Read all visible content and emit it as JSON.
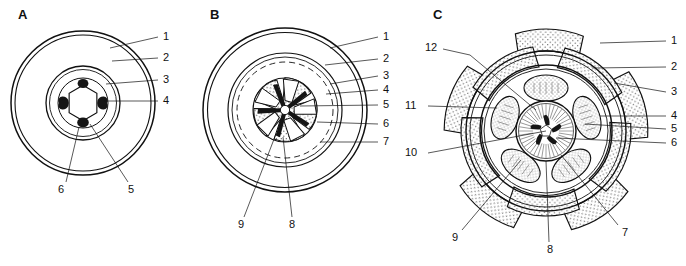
{
  "figure": {
    "background_color": "#ffffff",
    "ink_color": "#111111",
    "fill_black": "#151515",
    "stipple_color": "#555555",
    "panels": [
      {
        "letter": "A",
        "letter_x": 18,
        "letter_y": 8,
        "center_x": 83,
        "center_y": 103,
        "callouts": [
          {
            "label": "1",
            "x": 163,
            "y": 36
          },
          {
            "label": "2",
            "x": 163,
            "y": 57
          },
          {
            "label": "3",
            "x": 163,
            "y": 79
          },
          {
            "label": "4",
            "x": 163,
            "y": 100
          },
          {
            "label": "5",
            "x": 131,
            "y": 189
          },
          {
            "label": "6",
            "x": 60,
            "y": 189
          }
        ]
      },
      {
        "letter": "B",
        "letter_x": 210,
        "letter_y": 8,
        "center_x": 285,
        "center_y": 110,
        "callouts": [
          {
            "label": "1",
            "x": 383,
            "y": 36
          },
          {
            "label": "2",
            "x": 383,
            "y": 58
          },
          {
            "label": "3",
            "x": 383,
            "y": 75
          },
          {
            "label": "4",
            "x": 383,
            "y": 89
          },
          {
            "label": "5",
            "x": 383,
            "y": 104
          },
          {
            "label": "6",
            "x": 383,
            "y": 123
          },
          {
            "label": "7",
            "x": 383,
            "y": 141
          },
          {
            "label": "8",
            "x": 288,
            "y": 224
          },
          {
            "label": "9",
            "x": 238,
            "y": 224
          }
        ]
      },
      {
        "letter": "C",
        "letter_x": 433,
        "letter_y": 8,
        "center_x": 546,
        "center_y": 131,
        "callouts": [
          {
            "label": "1",
            "x": 671,
            "y": 40
          },
          {
            "label": "2",
            "x": 671,
            "y": 66
          },
          {
            "label": "3",
            "x": 671,
            "y": 91
          },
          {
            "label": "4",
            "x": 671,
            "y": 115
          },
          {
            "label": "5",
            "x": 671,
            "y": 128
          },
          {
            "label": "6",
            "x": 671,
            "y": 142
          },
          {
            "label": "7",
            "x": 622,
            "y": 232
          },
          {
            "label": "8",
            "x": 549,
            "y": 249
          },
          {
            "label": "9",
            "x": 452,
            "y": 237
          },
          {
            "label": "10",
            "x": 405,
            "y": 152
          },
          {
            "label": "11",
            "x": 405,
            "y": 105
          },
          {
            "label": "12",
            "x": 429,
            "y": 47
          }
        ]
      }
    ]
  }
}
